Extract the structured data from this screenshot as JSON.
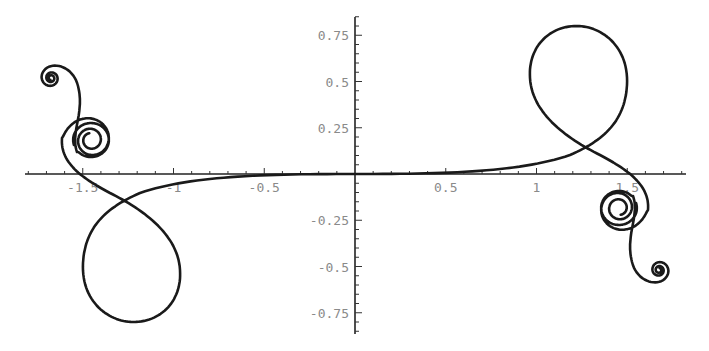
{
  "chart_data": {
    "type": "line",
    "title": "",
    "xlabel": "",
    "ylabel": "",
    "xlim": [
      -1.8,
      1.82
    ],
    "ylim": [
      -0.84,
      0.84
    ],
    "grid": false,
    "legend": null,
    "x_ticks": [
      {
        "value": -1.5,
        "label": "-1.5"
      },
      {
        "value": -1,
        "label": "-1"
      },
      {
        "value": -0.5,
        "label": "-0.5"
      },
      {
        "value": 0.5,
        "label": "0.5"
      },
      {
        "value": 1,
        "label": "1"
      },
      {
        "value": 1.5,
        "label": "1.5"
      }
    ],
    "y_ticks": [
      {
        "value": 0.75,
        "label": "0.75"
      },
      {
        "value": 0.5,
        "label": "0.5"
      },
      {
        "value": 0.25,
        "label": "0.25"
      },
      {
        "value": -0.25,
        "label": "-0.25"
      },
      {
        "value": -0.5,
        "label": "-0.5"
      },
      {
        "value": -0.75,
        "label": "-0.75"
      }
    ],
    "series": [
      {
        "name": "parametric curve",
        "description": "Point-symmetric parametric curve: flat through origin, a loop in each half-plane, then spiraling into two nested spiral centers at each end",
        "key_points": [
          {
            "label": "spiral-end-left",
            "x": -1.67,
            "y": 0.52
          },
          {
            "label": "spiral-center-left",
            "x": -1.45,
            "y": 0.19
          },
          {
            "label": "crossing-left",
            "x": -1.27,
            "y": -0.17
          },
          {
            "label": "loop-bottom-left",
            "x": -1.2,
            "y": -0.8
          },
          {
            "label": "origin",
            "x": 0,
            "y": 0
          },
          {
            "label": "loop-top-right",
            "x": 1.2,
            "y": 0.8
          },
          {
            "label": "crossing-right",
            "x": 1.29,
            "y": 0.17
          },
          {
            "label": "spiral-center-right",
            "x": 1.45,
            "y": -0.19
          },
          {
            "label": "spiral-end-right",
            "x": 1.68,
            "y": -0.52
          }
        ]
      }
    ]
  },
  "axes": {
    "x_origin_px": 355,
    "y_origin_px": 174,
    "x_scale_px": 181.5,
    "y_scale_px": 185
  }
}
